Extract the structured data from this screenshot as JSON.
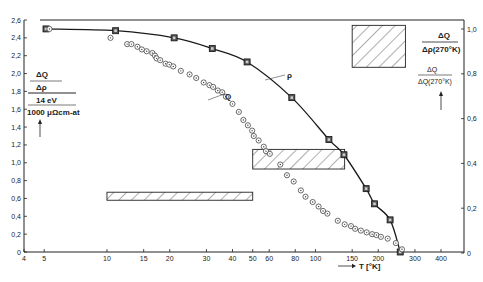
{
  "chart_data": {
    "type": "scatter",
    "title": "",
    "xlabel": "T [°K]",
    "xscale": "log",
    "xlim": [
      4,
      400
    ],
    "x_ticks": [
      4,
      5,
      10,
      15,
      20,
      30,
      40,
      50,
      60,
      80,
      100,
      150,
      200,
      300,
      400
    ],
    "x_tick_labels": [
      "4",
      "5",
      "10",
      "15",
      "20",
      "30",
      "40",
      "50",
      "60",
      "80",
      "100",
      "150",
      "200",
      "300",
      "400"
    ],
    "y_left": {
      "label_lines": [
        "ΔQ",
        "Δρ",
        "14 eV",
        "1000 μΩcm-at"
      ],
      "ylim": [
        0,
        2.6
      ],
      "ticks": [
        0,
        0.2,
        0.4,
        0.6,
        0.8,
        1.0,
        1.2,
        1.4,
        1.6,
        1.8,
        2.0,
        2.2,
        2.4,
        2.6
      ],
      "tick_labels": [
        "0",
        "0,2",
        "0,4",
        "0,6",
        "0,8",
        "1,0",
        "1,2",
        "1,4",
        "1,6",
        "1,8",
        "2,0",
        "2,2",
        "2,4",
        "2,6"
      ]
    },
    "y_right": {
      "label_top": {
        "num": "ΔQ",
        "den": "Δρ(270°K)"
      },
      "label_bottom": {
        "num": "ΔQ",
        "den": "ΔQ(270°K)"
      },
      "ylim": [
        0,
        1.0
      ],
      "ticks": [
        0,
        0.2,
        0.4,
        0.6,
        0.8,
        1.0
      ],
      "tick_labels": [
        "0",
        "0,2",
        "0,4",
        "0,6",
        "0,8",
        "1,0"
      ]
    },
    "legend": [],
    "curve_labels": [
      {
        "text": "ρ",
        "series": "rho_ratio"
      },
      {
        "text": "Q",
        "series": "Q_ratio"
      }
    ],
    "grid": false,
    "series": [
      {
        "name": "rho_ratio",
        "label": "ρ",
        "marker": "square",
        "line": "solid",
        "axis": "left",
        "x": [
          5.1,
          11,
          21,
          32,
          47,
          77,
          116,
          137,
          175,
          192,
          228,
          255
        ],
        "y": [
          2.5,
          2.48,
          2.4,
          2.28,
          2.13,
          1.73,
          1.26,
          1.09,
          0.71,
          0.54,
          0.36,
          0.0
        ]
      },
      {
        "name": "Q_ratio",
        "label": "Q",
        "marker": "circle-dot",
        "line": "none",
        "axis": "left",
        "x": [
          5.3,
          10.4,
          12.5,
          13.1,
          14.0,
          14.7,
          15.5,
          16.5,
          17.0,
          17.3,
          18.0,
          19.1,
          19.9,
          20.8,
          22.6,
          24.9,
          26.8,
          29.1,
          31.0,
          32.3,
          34.0,
          35.7,
          37.2,
          40.0,
          42.9,
          45.1,
          47.4,
          49.7,
          50.6,
          53.4,
          56.5,
          57.9,
          60.4,
          67.8,
          73.0,
          78.6,
          85.1,
          89.6,
          97.0,
          103.5,
          108.7,
          114.1,
          128.0,
          138.0,
          148.0,
          155.0,
          165.0,
          176.0,
          187.0,
          196.0,
          206.0,
          222.0,
          243.0,
          260.0
        ],
        "y": [
          2.5,
          2.4,
          2.33,
          2.33,
          2.3,
          2.27,
          2.25,
          2.23,
          2.2,
          2.17,
          2.15,
          2.11,
          2.1,
          2.08,
          2.03,
          1.99,
          1.95,
          1.9,
          1.87,
          1.85,
          1.81,
          1.79,
          1.74,
          1.66,
          1.57,
          1.48,
          1.42,
          1.36,
          1.3,
          1.25,
          1.18,
          1.13,
          1.1,
          0.98,
          0.86,
          0.79,
          0.69,
          0.62,
          0.56,
          0.51,
          0.46,
          0.43,
          0.35,
          0.31,
          0.29,
          0.26,
          0.24,
          0.22,
          0.2,
          0.19,
          0.17,
          0.15,
          0.1,
          0.03
        ]
      }
    ],
    "hatched_regions": [
      {
        "x0": 10,
        "x1": 50,
        "y0": 0.58,
        "y1": 0.67
      },
      {
        "x0": 50,
        "x1": 138,
        "y0": 0.93,
        "y1": 1.15
      },
      {
        "x0": 150,
        "x1": 270,
        "y0": 2.07,
        "y1": 2.54
      }
    ]
  }
}
